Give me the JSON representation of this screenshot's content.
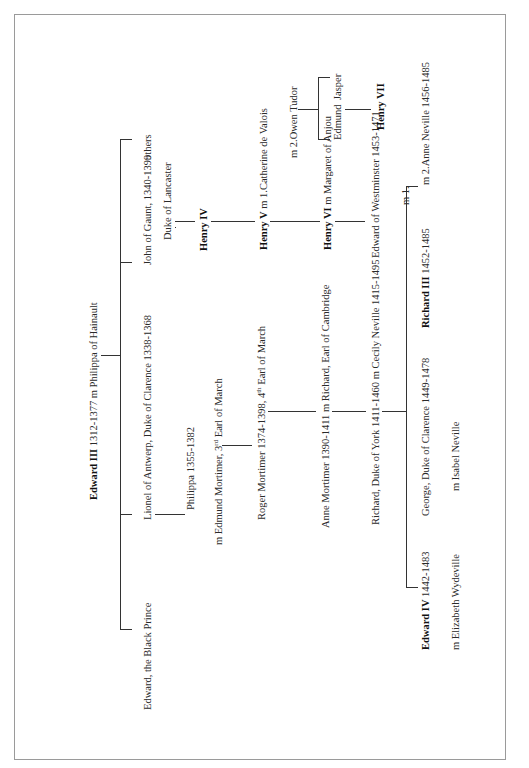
{
  "document": {
    "type": "family-tree",
    "orientation": "rotated-90-ccw",
    "root": {
      "name": "Edward III",
      "dates": "1312-1377",
      "spouse_text": "m Philippa of Hainault"
    },
    "children": {
      "black_prince": "Edward, the Black Prince",
      "lionel": "Lionel of Antwerp, Duke of Clarence 1338-1368",
      "john_of_gaunt": "John of Gaunt, 1340-1399",
      "john_title": "Duke of Lancaster",
      "others": "others"
    },
    "york_line": {
      "philippa": "Philippa 1355-1382",
      "edmund_mortimer_prefix": "m Edmund Mortimer, 3",
      "edmund_mortimer_sup": "rd",
      "edmund_mortimer_suffix": " Earl of March",
      "roger_mortimer_prefix": "Roger Mortimer 1374-1398, 4",
      "roger_mortimer_sup": "th",
      "roger_mortimer_suffix": " Earl of March",
      "anne_mortimer": "Anne Mortimer 1390-1411 m Richard, Earl of Cambridge",
      "richard_york": "Richard, Duke of York 1411-1460  m Cecily Neville 1415-1495"
    },
    "york_children": {
      "edward_iv_name": "Edward IV",
      "edward_iv_dates": " 1442-1483",
      "edward_iv_spouse": "m Elizabeth Wydeville",
      "george": "George, Duke of Clarence 1449-1478",
      "george_spouse": "m Isabel Neville",
      "richard_iii_name": "Richard III",
      "richard_iii_dates": " 1452-1485",
      "richard_iii_spouse": "m 2.Anne Neville 1456-1485"
    },
    "lancaster_line": {
      "henry_iv": "Henry IV",
      "henry_v_name": "Henry V",
      "henry_v_spouse": " m  1.Catherine de Valois",
      "catherine_second": "m 2.Owen Tudor",
      "henry_vi_name": "Henry VI",
      "henry_vi_spouse": " m Margaret of Anjou",
      "edward_westminster": "Edward of Westminster 1453-1471",
      "edward_westminster_m": "m 1.",
      "edmund": "Edmund",
      "jasper": "Jasper",
      "henry_vii": "Henry VII"
    }
  }
}
